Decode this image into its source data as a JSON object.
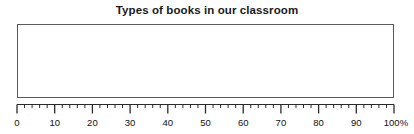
{
  "chart_data": {
    "type": "bar",
    "title": "Types of books in our classroom",
    "xlabel": "",
    "ylabel": "",
    "categories": [],
    "values": [],
    "series": [],
    "xlim": [
      0,
      100
    ],
    "grid": false,
    "legend": "none",
    "note": "empty bar-chart template: plot area contains no plotted bars",
    "axis": {
      "unit_suffix": "%",
      "major_step": 10,
      "mid_step": 5,
      "minor_step": 2,
      "tick_labels": [
        "0",
        "10",
        "20",
        "30",
        "40",
        "50",
        "60",
        "70",
        "80",
        "90",
        "100%"
      ],
      "tick_values": [
        0,
        10,
        20,
        30,
        40,
        50,
        60,
        70,
        80,
        90,
        100
      ]
    }
  },
  "colors": {
    "background": "#ffffff",
    "title_text": "#1a1a1a",
    "plot_border": "#5a5a5a",
    "axis_line": "#2b2b2b",
    "tick_mark": "#2b2b2b",
    "tick_label_text": "#111111"
  }
}
